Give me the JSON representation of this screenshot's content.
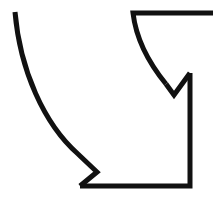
{
  "canvas": {
    "width": 213,
    "height": 216,
    "background_color": "#ffffff",
    "title": "Arrow-like line drawing glyph"
  },
  "drawing": {
    "name": "curved-arrow-outline-glyph",
    "description": "Black outline line-art mark: a long concave sweeping curve on the left ending in a small arrowhead notch at the bottom, a right-angled bracket form on the right with a top horizontal bar running off the right edge, and a small downward V notch on the upper right.",
    "stroke_color": "#111111",
    "fill_color": "none",
    "stroke_width": 5,
    "stroke_linejoin": "miter",
    "stroke_linecap": "butt",
    "paths": [
      {
        "id": "left-sweep-curve",
        "label": "left outer concave sweep with arrow notch",
        "d": "M 15 12 C 20 70, 44 124, 78 154 L 97 172 L 80 186"
      },
      {
        "id": "bottom-and-right-frame",
        "label": "bottom edge, right vertical edge up to notch",
        "d": "M 80 186 L 190 186 L 190 73"
      },
      {
        "id": "upper-right-v-notch",
        "label": "downward V notch joining right edge to inner curve",
        "d": "M 190 73 L 174 95 L 166 84"
      },
      {
        "id": "inner-curve-and-top-bar",
        "label": "inner concave curve rising to the top horizontal bar",
        "d": "M 166 84 C 148 62, 136 38, 133 13 L 213 13"
      }
    ],
    "anchor_points": {
      "curve_top_start": [
        15,
        12
      ],
      "curve_lower_end": [
        78,
        154
      ],
      "left_notch_apex": [
        97,
        172
      ],
      "bottom_left_corner": [
        80,
        186
      ],
      "bottom_right_corner": [
        190,
        186
      ],
      "right_edge_top": [
        190,
        73
      ],
      "inner_v_apex": [
        174,
        95
      ],
      "inner_curve_top": [
        133,
        13
      ],
      "top_bar_right_end": [
        213,
        13
      ]
    }
  }
}
